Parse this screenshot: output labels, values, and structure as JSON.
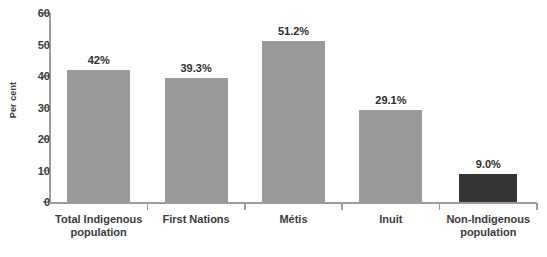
{
  "chart_data": {
    "type": "bar",
    "title": "",
    "subtitle": "",
    "xlabel": "",
    "ylabel": "Per cent",
    "ylim": [
      0,
      60
    ],
    "ytick_step": 10,
    "grid": false,
    "legend": null,
    "categories": [
      "Total Indigenous population",
      "First Nations",
      "Métis",
      "Inuit",
      "Non-Indigenous population"
    ],
    "category_lines": [
      [
        "Total Indigenous",
        "population"
      ],
      [
        "First Nations"
      ],
      [
        "Métis"
      ],
      [
        "Inuit"
      ],
      [
        "Non-Indigenous",
        "population"
      ]
    ],
    "values": [
      42.0,
      39.3,
      51.2,
      29.1,
      9.0
    ],
    "value_labels": [
      "42%",
      "39.3%",
      "51.2%",
      "29.1%",
      "9.0%"
    ],
    "bar_colors": [
      "#9a9a9a",
      "#9a9a9a",
      "#9a9a9a",
      "#9a9a9a",
      "#333333"
    ],
    "ytick_labels": [
      "0",
      "10",
      "20",
      "30",
      "40",
      "50",
      "60"
    ],
    "ytick_values": [
      0,
      10,
      20,
      30,
      40,
      50,
      60
    ]
  },
  "colors": {
    "bar_gray": "#9a9a9a",
    "bar_dark": "#333333",
    "axis": "#9b9b9b",
    "text": "#3b3b3b",
    "background": "#ffffff"
  }
}
